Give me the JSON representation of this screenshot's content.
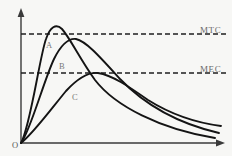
{
  "figure": {
    "title": "",
    "background_color": "#f7f7f5",
    "line_color": "#1a1a1a",
    "axis_color": "#3a3a3a",
    "label_color": "#6f6f6f"
  },
  "axes": {
    "origin_label": "O",
    "y_axis_name": "y-axis",
    "x_axis_name": "x-axis",
    "y_axis_label": "",
    "x_axis_label": ""
  },
  "reference_lines": [
    {
      "id": "mtc",
      "label": "MTC",
      "y": 34,
      "style": "dashed"
    },
    {
      "id": "mec",
      "label": "MEC",
      "y": 73,
      "style": "dashed"
    }
  ],
  "curves": [
    {
      "id": "A",
      "label": "A",
      "label_x": 46,
      "label_y": 41,
      "peak_x": 53,
      "peak_y": 25
    },
    {
      "id": "B",
      "label": "B",
      "label_x": 59,
      "label_y": 62,
      "peak_x": 73,
      "peak_y": 38
    },
    {
      "id": "C",
      "label": "C",
      "label_x": 72,
      "label_y": 93,
      "peak_x": 95,
      "peak_y": 73
    }
  ],
  "chart_data": {
    "type": "line",
    "title": "",
    "xlabel": "",
    "ylabel": "",
    "xlim": [
      0,
      232
    ],
    "ylim": [
      0,
      156
    ],
    "grid": false,
    "legend": "inline-curve-labels",
    "annotations": [
      {
        "text": "MTC",
        "x": 200,
        "y": 31
      },
      {
        "text": "MEC",
        "x": 200,
        "y": 70
      },
      {
        "text": "A",
        "x": 46,
        "y": 41
      },
      {
        "text": "B",
        "x": 59,
        "y": 62
      },
      {
        "text": "C",
        "x": 72,
        "y": 93
      },
      {
        "text": "O",
        "x": 13,
        "y": 143
      }
    ],
    "reference_levels": [
      {
        "name": "MTC",
        "value": 34
      },
      {
        "name": "MEC",
        "value": 73
      }
    ],
    "series": [
      {
        "name": "A",
        "path": "M 21 143 C 30 128, 40 55, 46 39 C 50 27, 56 23, 62 29 C 70 38, 80 59, 95 80 C 115 106, 160 129, 215 138",
        "peak": {
          "x": 53,
          "y": 25
        },
        "end": {
          "x": 215,
          "y": 138
        }
      },
      {
        "name": "B",
        "path": "M 21 143 C 30 132, 44 80, 54 59 C 60 47, 68 38, 76 39 C 86 41, 100 57, 120 79 C 145 105, 180 124, 219 133",
        "peak": {
          "x": 73,
          "y": 38
        },
        "end": {
          "x": 219,
          "y": 133
        }
      },
      {
        "name": "C",
        "path": "M 21 143 C 32 135, 52 108, 66 91 C 78 78, 88 72, 98 73 C 112 75, 128 86, 148 100 C 172 115, 198 123, 221 126",
        "peak": {
          "x": 95,
          "y": 73
        },
        "end": {
          "x": 221,
          "y": 126
        }
      }
    ]
  }
}
